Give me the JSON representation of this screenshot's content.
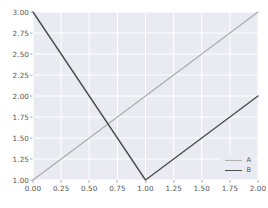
{
  "figure": {
    "background_color": "#ffffff",
    "axes_background_color": "#eaeaf2",
    "grid_color": "#ffffff",
    "tick_label_color": "#555555"
  },
  "chart_data": {
    "type": "line",
    "title": "",
    "xlabel": "",
    "ylabel": "",
    "xlim": [
      0.0,
      2.0
    ],
    "ylim": [
      1.0,
      3.0
    ],
    "grid": true,
    "legend_position": "lower right",
    "xticks": [
      0.0,
      0.25,
      0.5,
      0.75,
      1.0,
      1.25,
      1.5,
      1.75,
      2.0
    ],
    "xtick_labels": [
      "0.00",
      "0.25",
      "0.50",
      "0.75",
      "1.00",
      "1.25",
      "1.50",
      "1.75",
      "2.00"
    ],
    "yticks": [
      1.0,
      1.25,
      1.5,
      1.75,
      2.0,
      2.25,
      2.5,
      2.75,
      3.0
    ],
    "ytick_labels": [
      "1.00",
      "1.25",
      "1.50",
      "1.75",
      "2.00",
      "2.25",
      "2.50",
      "2.75",
      "3.00"
    ],
    "series": [
      {
        "name": "A",
        "color": "#b0b0b0",
        "linewidth": 1.4,
        "x": [
          0.0,
          1.0,
          2.0
        ],
        "values": [
          1.0,
          2.0,
          3.0
        ]
      },
      {
        "name": "B",
        "color": "#4d4d4d",
        "linewidth": 1.4,
        "x": [
          0.0,
          1.0,
          2.0
        ],
        "values": [
          3.0,
          1.0,
          2.0
        ]
      }
    ]
  },
  "legend": {
    "entries": [
      {
        "label": "A",
        "color": "#b0b0b0"
      },
      {
        "label": "B",
        "color": "#4d4d4d"
      }
    ]
  }
}
